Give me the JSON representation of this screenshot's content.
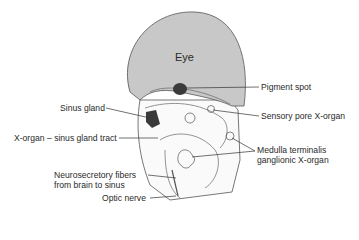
{
  "figure": {
    "eye_label": "Eye",
    "labels": {
      "pigment_spot": "Pigment spot",
      "sensory_pore": "Sensory pore X-organ",
      "sinus_gland": "Sinus gland",
      "tract": "X-organ – sinus gland tract",
      "medulla_line1": "Medulla terminalis",
      "medulla_line2": "ganglionic X-organ",
      "neuro_line1": "Neurosecretory fibers",
      "neuro_line2": "from brain to sinus",
      "optic_nerve": "Optic nerve"
    },
    "colors": {
      "eye_fill": "#c8c8c8",
      "dark_structure": "#3a3a3a",
      "line": "#333333"
    }
  }
}
